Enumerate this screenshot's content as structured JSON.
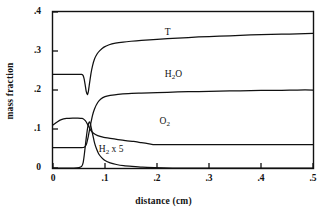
{
  "chart_data": {
    "type": "line",
    "title": "",
    "subtitle": "",
    "xlabel": "distance (cm)",
    "ylabel": "mass fraction",
    "xlim": [
      0,
      0.5
    ],
    "ylim": [
      0,
      0.4
    ],
    "xticks": [
      0,
      0.1,
      0.2,
      0.3,
      0.4,
      0.5
    ],
    "xtick_labels": [
      "0",
      ".1",
      ".2",
      ".3",
      ".4",
      ".5"
    ],
    "yticks": [
      0,
      0.1,
      0.2,
      0.3,
      0.4
    ],
    "ytick_labels": [
      "0",
      ".1",
      ".2",
      ".3",
      ".4"
    ],
    "grid": false,
    "legend": "inline-annotations",
    "frame": "box",
    "line_color": "#111111",
    "background_color": "#ffffff",
    "annotations": [
      {
        "name": "T",
        "text": "T",
        "x": 0.215,
        "y": 0.345
      },
      {
        "name": "H2O",
        "text": "H2O",
        "html": "H<sub>2</sub>O",
        "x": 0.215,
        "y": 0.238
      },
      {
        "name": "O2",
        "text": "O2",
        "html": "O<sub>2</sub>",
        "x": 0.205,
        "y": 0.118
      },
      {
        "name": "H2x5",
        "text": "H2 x 5",
        "html": "H<sub>2</sub> x 5",
        "x": 0.088,
        "y": 0.046
      }
    ],
    "series": [
      {
        "name": "T",
        "label": "T",
        "points": [
          [
            0.0,
            0.24
          ],
          [
            0.02,
            0.24
          ],
          [
            0.038,
            0.24
          ],
          [
            0.05,
            0.24
          ],
          [
            0.055,
            0.24
          ],
          [
            0.058,
            0.237
          ],
          [
            0.06,
            0.228
          ],
          [
            0.062,
            0.212
          ],
          [
            0.064,
            0.196
          ],
          [
            0.066,
            0.188
          ],
          [
            0.068,
            0.196
          ],
          [
            0.07,
            0.215
          ],
          [
            0.073,
            0.242
          ],
          [
            0.076,
            0.262
          ],
          [
            0.08,
            0.28
          ],
          [
            0.085,
            0.293
          ],
          [
            0.09,
            0.301
          ],
          [
            0.098,
            0.31
          ],
          [
            0.108,
            0.316
          ],
          [
            0.12,
            0.32
          ],
          [
            0.135,
            0.323
          ],
          [
            0.15,
            0.325
          ],
          [
            0.17,
            0.327
          ],
          [
            0.2,
            0.33
          ],
          [
            0.24,
            0.333
          ],
          [
            0.28,
            0.336
          ],
          [
            0.32,
            0.338
          ],
          [
            0.36,
            0.34
          ],
          [
            0.4,
            0.342
          ],
          [
            0.44,
            0.343
          ],
          [
            0.47,
            0.344
          ],
          [
            0.5,
            0.345
          ]
        ]
      },
      {
        "name": "H2O",
        "label": "H2O",
        "points": [
          [
            0.0,
            0.052
          ],
          [
            0.02,
            0.052
          ],
          [
            0.038,
            0.052
          ],
          [
            0.05,
            0.052
          ],
          [
            0.055,
            0.052
          ],
          [
            0.06,
            0.053
          ],
          [
            0.064,
            0.06
          ],
          [
            0.068,
            0.082
          ],
          [
            0.072,
            0.11
          ],
          [
            0.076,
            0.135
          ],
          [
            0.08,
            0.152
          ],
          [
            0.086,
            0.168
          ],
          [
            0.092,
            0.177
          ],
          [
            0.1,
            0.183
          ],
          [
            0.11,
            0.186
          ],
          [
            0.125,
            0.189
          ],
          [
            0.145,
            0.191
          ],
          [
            0.17,
            0.192
          ],
          [
            0.2,
            0.193
          ],
          [
            0.24,
            0.195
          ],
          [
            0.28,
            0.196
          ],
          [
            0.32,
            0.197
          ],
          [
            0.36,
            0.198
          ],
          [
            0.4,
            0.199
          ],
          [
            0.44,
            0.199
          ],
          [
            0.47,
            0.2
          ],
          [
            0.5,
            0.2
          ]
        ]
      },
      {
        "name": "O2",
        "label": "O2",
        "points": [
          [
            0.0,
            0.11
          ],
          [
            0.008,
            0.118
          ],
          [
            0.016,
            0.124
          ],
          [
            0.026,
            0.127
          ],
          [
            0.038,
            0.128
          ],
          [
            0.048,
            0.128
          ],
          [
            0.056,
            0.127
          ],
          [
            0.06,
            0.124
          ],
          [
            0.064,
            0.118
          ],
          [
            0.068,
            0.108
          ],
          [
            0.072,
            0.098
          ],
          [
            0.078,
            0.089
          ],
          [
            0.086,
            0.083
          ],
          [
            0.096,
            0.079
          ],
          [
            0.11,
            0.076
          ],
          [
            0.125,
            0.073
          ],
          [
            0.14,
            0.07
          ],
          [
            0.155,
            0.068
          ],
          [
            0.17,
            0.065
          ],
          [
            0.185,
            0.062
          ],
          [
            0.195,
            0.06
          ],
          [
            0.21,
            0.06
          ],
          [
            0.25,
            0.06
          ],
          [
            0.3,
            0.06
          ],
          [
            0.35,
            0.06
          ],
          [
            0.4,
            0.06
          ],
          [
            0.45,
            0.06
          ],
          [
            0.5,
            0.06
          ]
        ]
      },
      {
        "name": "H2x5",
        "label": "H2 x 5",
        "points": [
          [
            0.0,
            0.0
          ],
          [
            0.02,
            0.0
          ],
          [
            0.04,
            0.0
          ],
          [
            0.05,
            0.001
          ],
          [
            0.055,
            0.004
          ],
          [
            0.058,
            0.014
          ],
          [
            0.06,
            0.032
          ],
          [
            0.062,
            0.055
          ],
          [
            0.064,
            0.078
          ],
          [
            0.066,
            0.098
          ],
          [
            0.068,
            0.112
          ],
          [
            0.07,
            0.118
          ],
          [
            0.072,
            0.113
          ],
          [
            0.074,
            0.1
          ],
          [
            0.077,
            0.082
          ],
          [
            0.08,
            0.064
          ],
          [
            0.084,
            0.048
          ],
          [
            0.088,
            0.036
          ],
          [
            0.094,
            0.026
          ],
          [
            0.1,
            0.019
          ],
          [
            0.11,
            0.013
          ],
          [
            0.122,
            0.009
          ],
          [
            0.136,
            0.006
          ],
          [
            0.152,
            0.004
          ],
          [
            0.172,
            0.002
          ],
          [
            0.195,
            0.001
          ],
          [
            0.23,
            0.0
          ],
          [
            0.28,
            0.0
          ],
          [
            0.34,
            0.0
          ],
          [
            0.42,
            0.0
          ],
          [
            0.5,
            0.0
          ]
        ]
      }
    ]
  }
}
